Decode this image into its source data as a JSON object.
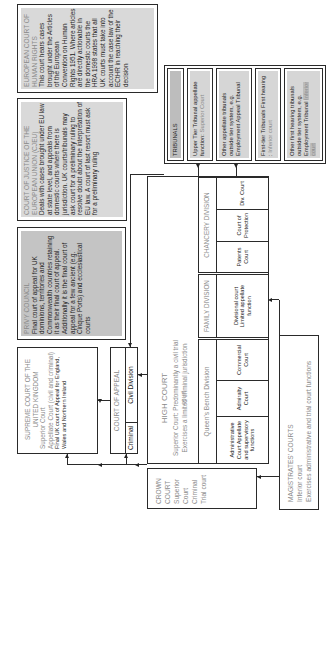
{
  "echr": {
    "title1": "EUROPEAN COURT OF",
    "title2": "HUMAN RIGHTS",
    "body": "This court hears cases brought under the Articles of the European Convention on Human Rights 1951. Where articles are directly actionable in the domestic courts the HRA 1998 states that all UK courts must take into account the case law of the ECtHR in reaching their decision"
  },
  "cjeu": {
    "title1": "COURT OF JUSTICE OF THE",
    "title2": "EUROPEAN UNION (CJEU)",
    "body": "Deals with cases brought under EU law at state level, and appeals from domestic courts where there is jurisdiction. UK courts/tribunals may ask court for a preliminary ruling to resolve doubt about the interpretation of EU law. A court of last resort must ask for a preliminary ruling"
  },
  "privy": {
    "title": "PRIVY COUNCIL",
    "body": "Final court of appeal for UK dominions, territories and Commonwealth countries retaining it as their final court of appeal. Additionally it is the final court of appeal for a few ancient (e.g. Cinque Ports) and ecclesiastical courts"
  },
  "supreme": {
    "title1": "SUPREME COURT OF THE",
    "title2": "UNITED KINGDOM",
    "line1": "Superior Court",
    "line2": "Appellate Court (civil and criminal)",
    "line3": "Final UK court of Appeal for England, Wales and Northern Ireland"
  },
  "appeal": {
    "title": "COURT OF APPEAL",
    "criminal": "Criminal",
    "civil": "Civil Division"
  },
  "high_court": {
    "title": "HIGH COURT",
    "line1": "Superior Court: Predominantly a civil trial court",
    "line2": "Exercises a limited criminal jurisdiction",
    "qbd": {
      "title": "Queen's Bench Division",
      "cells": [
        "Administrative Court Appellate and supervisory functions",
        "Admiralty Court",
        "Commercial Court"
      ]
    },
    "family": {
      "title": "FAMILY DIVISION",
      "cell": "Divisional court Limited appellate function"
    },
    "chancery": {
      "title": "CHANCERY DIVISION",
      "cells": [
        "Patents Court",
        "Court of Protection",
        "Div. Court"
      ]
    }
  },
  "tribunals": {
    "title": "TRIBUNALS",
    "items": [
      {
        "text": "Upper Tier Tribunal appellate function:",
        "muted": "Superior Court"
      },
      {
        "text": "Other appellate tribunals outside tier system, e.g. Employment Appeal Tribunal",
        "muted": ""
      },
      {
        "text": "First-tier Tribunals First hearing :",
        "muted": "Inferior court"
      },
      {
        "text": "Other first hearing tribunals outside tier system, e.g. Employment Tribunal",
        "muted": "Inferior court"
      }
    ]
  },
  "crown": {
    "lines": [
      "CROWN",
      "COURT",
      "Superior",
      "Court",
      "Criminal",
      "Trial court"
    ]
  },
  "magistrates": {
    "title": "MAGISTRATES' COURTS",
    "line1": "Inferior court",
    "line2": "Exercises administrative and trial court  functions"
  }
}
